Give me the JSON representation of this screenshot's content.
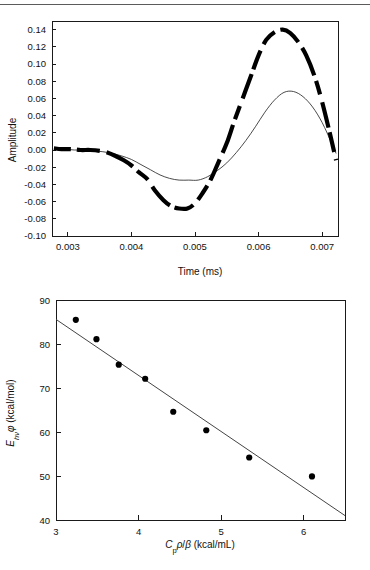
{
  "page": {
    "background": "#ffffff",
    "rule_color": "#5b5b5b",
    "width": 370,
    "height": 570
  },
  "chart_data": [
    {
      "id": "amplitude-vs-time",
      "type": "line",
      "title": "",
      "xlabel": "Time (ms)",
      "ylabel": "Amplitude",
      "xlim": [
        0.00275,
        0.00725
      ],
      "ylim": [
        -0.1,
        0.15
      ],
      "xticks": [
        0.003,
        0.004,
        0.005,
        0.006,
        0.007
      ],
      "xticklabels": [
        "0.003",
        "0.004",
        "0.005",
        "0.006",
        "0.007"
      ],
      "yticks": [
        -0.1,
        -0.08,
        -0.06,
        -0.04,
        -0.02,
        0.0,
        0.02,
        0.04,
        0.06,
        0.08,
        0.1,
        0.12,
        0.14
      ],
      "yticklabels": [
        "-0.10",
        "-0.08",
        "-0.06",
        "-0.04",
        "-0.02",
        "0.00",
        "0.02",
        "0.04",
        "0.06",
        "0.08",
        "0.10",
        "0.12",
        "0.14"
      ],
      "grid": false,
      "legend": "none",
      "series": [
        {
          "name": "experimental-trace-thick-dashed",
          "style": "thick-dashed",
          "color": "#000000",
          "description": "Large-amplitude noisy acoustic waveform, minimum about -0.068 near 0.00490 ms, maximum about 0.140 near 0.00638 ms",
          "x": [
            0.00278,
            0.0029,
            0.00305,
            0.0032,
            0.00335,
            0.0035,
            0.00362,
            0.00375,
            0.00388,
            0.004,
            0.00412,
            0.00425,
            0.00437,
            0.0045,
            0.00462,
            0.00475,
            0.00488,
            0.005,
            0.00512,
            0.00525,
            0.00537,
            0.0055,
            0.00562,
            0.00575,
            0.00588,
            0.006,
            0.00612,
            0.00625,
            0.00638,
            0.0065,
            0.00662,
            0.00675,
            0.00688,
            0.007,
            0.00712,
            0.00722
          ],
          "y": [
            0.002,
            0.001,
            0.001,
            0.0,
            0.0,
            -0.001,
            -0.003,
            -0.007,
            -0.012,
            -0.018,
            -0.026,
            -0.034,
            -0.047,
            -0.058,
            -0.065,
            -0.068,
            -0.068,
            -0.062,
            -0.05,
            -0.034,
            -0.014,
            0.008,
            0.034,
            0.06,
            0.086,
            0.11,
            0.128,
            0.137,
            0.14,
            0.136,
            0.126,
            0.11,
            0.086,
            0.056,
            0.02,
            -0.012
          ]
        },
        {
          "name": "fitted-model-thin",
          "style": "thin-solid",
          "color": "#2a2a2a",
          "description": "Smooth simulated waveform, minimum about -0.035 near 0.00500 ms, maximum about 0.068 near 0.00645 ms",
          "x": [
            0.00278,
            0.00295,
            0.0031,
            0.00325,
            0.0034,
            0.00355,
            0.0037,
            0.00385,
            0.004,
            0.00415,
            0.0043,
            0.00445,
            0.0046,
            0.00475,
            0.0049,
            0.00505,
            0.0052,
            0.00535,
            0.0055,
            0.00565,
            0.0058,
            0.00595,
            0.0061,
            0.00625,
            0.0064,
            0.00655,
            0.0067,
            0.00685,
            0.007,
            0.00715,
            0.00722
          ],
          "y": [
            0.001,
            0.001,
            0.0,
            0.0,
            -0.001,
            -0.002,
            -0.004,
            -0.007,
            -0.011,
            -0.017,
            -0.023,
            -0.029,
            -0.033,
            -0.035,
            -0.035,
            -0.035,
            -0.031,
            -0.024,
            -0.015,
            -0.003,
            0.011,
            0.027,
            0.044,
            0.058,
            0.067,
            0.068,
            0.062,
            0.05,
            0.032,
            0.008,
            -0.004
          ]
        }
      ]
    },
    {
      "id": "ehv-phi-vs-cp-rho-beta",
      "type": "scatter",
      "title": "",
      "xlabel": "Cpρ/β (kcal/mL)",
      "xlabel_parts": {
        "italic_c": "C",
        "sub_p": "p",
        "rho": "ρ",
        "slash": "/",
        "beta": "β",
        "units": " (kcal/mL)"
      },
      "ylabel": "Ehνφ (kcal/mol)",
      "ylabel_parts": {
        "italic_e": "E",
        "sub_hnu": "hν",
        "phi": "φ",
        "units": " (kcal/mol)"
      },
      "xlim": [
        3.0,
        6.5
      ],
      "ylim": [
        40,
        90
      ],
      "xticks": [
        3,
        4,
        5,
        6
      ],
      "xticklabels": [
        "3",
        "4",
        "5",
        "6"
      ],
      "yticks": [
        40,
        50,
        60,
        70,
        80,
        90
      ],
      "yticklabels": [
        "40",
        "50",
        "60",
        "70",
        "80",
        "90"
      ],
      "grid": false,
      "legend": "none",
      "points": [
        {
          "x": 3.24,
          "y": 85.5
        },
        {
          "x": 3.49,
          "y": 81.1
        },
        {
          "x": 3.76,
          "y": 75.3
        },
        {
          "x": 4.08,
          "y": 72.1
        },
        {
          "x": 4.42,
          "y": 64.6
        },
        {
          "x": 4.82,
          "y": 60.4
        },
        {
          "x": 5.34,
          "y": 54.2
        },
        {
          "x": 6.1,
          "y": 49.9
        }
      ],
      "fit_line": {
        "name": "linear-regression-line",
        "color": "#444444",
        "x": [
          3.0,
          6.5
        ],
        "y": [
          85.6,
          41.0
        ],
        "slope": -12.74,
        "intercept": 123.8
      }
    }
  ]
}
